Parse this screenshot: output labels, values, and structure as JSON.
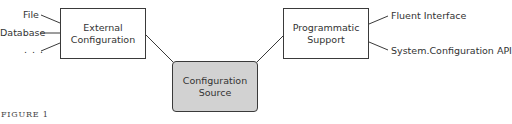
{
  "diagram": {
    "boxes": {
      "external": {
        "line1": "External",
        "line2": "Configuration"
      },
      "source": {
        "line1": "Configuration",
        "line2": "Source",
        "fill": "#d2d2d2"
      },
      "programmatic": {
        "line1": "Programmatic",
        "line2": "Support"
      }
    },
    "inputs_left": [
      "File",
      "Database",
      ". . ."
    ],
    "inputs_right": [
      "Fluent Interface",
      "System.Configuration API"
    ],
    "caption": "FIGURE 1"
  }
}
